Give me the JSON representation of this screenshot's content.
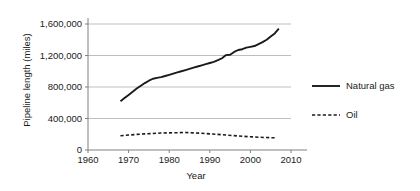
{
  "chart_data": {
    "type": "line",
    "title": "",
    "xlabel": "Year",
    "ylabel": "Pipeline length (miles)",
    "xlim": [
      1960,
      2010
    ],
    "ylim": [
      0,
      1600000
    ],
    "xticks": [
      "1960",
      "1970",
      "1980",
      "1990",
      "2000",
      "2010"
    ],
    "xtick_values": [
      1960,
      1970,
      1980,
      1990,
      2000,
      2010
    ],
    "yticks": [
      "0",
      "400,000",
      "800,000",
      "1,200,000",
      "1,600,000"
    ],
    "ytick_values": [
      0,
      400000,
      800000,
      1200000,
      1600000
    ],
    "grid": "horizontal",
    "legend_position": "right",
    "line_color": "#1a1a1a",
    "grid_color": "#bfbfbf",
    "axis_color": "#808080",
    "series": [
      {
        "name": "Natural gas",
        "style": "solid",
        "x": [
          1968,
          1969,
          1970,
          1971,
          1972,
          1973,
          1974,
          1975,
          1976,
          1977,
          1978,
          1979,
          1980,
          1981,
          1982,
          1983,
          1984,
          1985,
          1986,
          1987,
          1988,
          1989,
          1990,
          1991,
          1992,
          1993,
          1994,
          1995,
          1996,
          1997,
          1998,
          1999,
          2000,
          2001,
          2002,
          2003,
          2004,
          2005,
          2006,
          2007
        ],
        "values": [
          620000,
          660000,
          700000,
          740000,
          780000,
          815000,
          850000,
          880000,
          905000,
          915000,
          925000,
          940000,
          955000,
          970000,
          985000,
          1000000,
          1015000,
          1030000,
          1045000,
          1060000,
          1075000,
          1090000,
          1105000,
          1120000,
          1140000,
          1165000,
          1205000,
          1210000,
          1245000,
          1270000,
          1280000,
          1300000,
          1310000,
          1320000,
          1345000,
          1370000,
          1400000,
          1440000,
          1480000,
          1540000
        ]
      },
      {
        "name": "Oil",
        "style": "dashed",
        "x": [
          1968,
          1970,
          1972,
          1974,
          1976,
          1978,
          1980,
          1982,
          1984,
          1986,
          1988,
          1990,
          1992,
          1994,
          1996,
          1998,
          2000,
          2002,
          2004,
          2006
        ],
        "values": [
          180000,
          190000,
          198000,
          205000,
          210000,
          215000,
          218000,
          220000,
          222000,
          218000,
          212000,
          205000,
          198000,
          190000,
          182000,
          175000,
          168000,
          162000,
          158000,
          155000
        ]
      }
    ]
  },
  "legend": {
    "items": [
      {
        "label": "Natural gas",
        "style": "solid"
      },
      {
        "label": "Oil",
        "style": "dashed"
      }
    ]
  }
}
